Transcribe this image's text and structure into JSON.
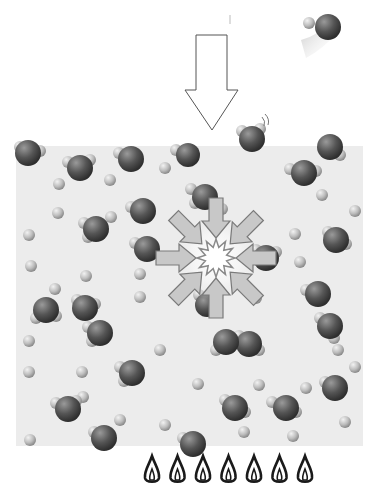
{
  "diagram": {
    "colors": {
      "background": "#ffffff",
      "liquid": "#ececec",
      "oxygen": "#555555",
      "hydrogen": "#b5b5b5",
      "arrow_fill": "#c8c8c8",
      "arrow_stroke": "#7a7a7a",
      "bubble_core": "#ffffff",
      "flame": "#1a1a1a"
    },
    "elements": {
      "pressure_arrow": "large-down-arrow",
      "escaping_molecule": "water-molecule-in-flight",
      "collapse_arrows_count": 8,
      "collapse_site": "starburst-bubble",
      "flames_count": 7
    }
  }
}
